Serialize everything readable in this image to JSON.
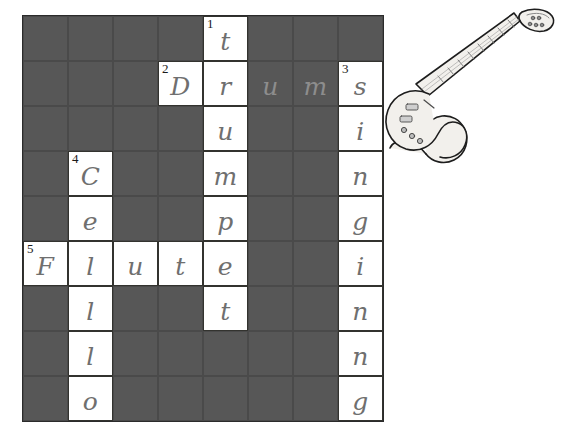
{
  "worksheet": {
    "title": "Musical instruments crossword",
    "grid": {
      "columns": 8,
      "rows": 9,
      "blocked_color": "#575757",
      "open_color": "#ffffff",
      "pencil_color": "#6f6f6f"
    },
    "clue_numbers": [
      {
        "number": "1",
        "row": 1,
        "col": 5
      },
      {
        "number": "2",
        "row": 2,
        "col": 4
      },
      {
        "number": "3",
        "row": 2,
        "col": 8
      },
      {
        "number": "4",
        "row": 4,
        "col": 2
      },
      {
        "number": "5",
        "row": 6,
        "col": 1
      }
    ],
    "answers": [
      {
        "number": "1",
        "direction": "down",
        "text": "TRUMPET"
      },
      {
        "number": "2",
        "direction": "across",
        "text": "DRUMS"
      },
      {
        "number": "3",
        "direction": "down",
        "text": "SINGING"
      },
      {
        "number": "4",
        "direction": "down",
        "text": "CELLO"
      },
      {
        "number": "5",
        "direction": "across",
        "text": "FLUTE"
      }
    ],
    "cells": [
      [
        {
          "state": "blocked",
          "letter": "",
          "num": ""
        },
        {
          "state": "blocked",
          "letter": "",
          "num": ""
        },
        {
          "state": "blocked",
          "letter": "",
          "num": ""
        },
        {
          "state": "blocked",
          "letter": "",
          "num": ""
        },
        {
          "state": "open",
          "letter": "t",
          "num": "1"
        },
        {
          "state": "blocked",
          "letter": "",
          "num": ""
        },
        {
          "state": "blocked",
          "letter": "",
          "num": ""
        },
        {
          "state": "blocked",
          "letter": "",
          "num": ""
        }
      ],
      [
        {
          "state": "blocked",
          "letter": "",
          "num": ""
        },
        {
          "state": "blocked",
          "letter": "",
          "num": ""
        },
        {
          "state": "blocked",
          "letter": "",
          "num": ""
        },
        {
          "state": "open",
          "letter": "D",
          "num": "2"
        },
        {
          "state": "open",
          "letter": "r",
          "num": ""
        },
        {
          "state": "blocked",
          "letter": "u",
          "num": ""
        },
        {
          "state": "blocked",
          "letter": "m",
          "num": ""
        },
        {
          "state": "open",
          "letter": "s",
          "num": "3"
        }
      ],
      [
        {
          "state": "blocked",
          "letter": "",
          "num": ""
        },
        {
          "state": "blocked",
          "letter": "",
          "num": ""
        },
        {
          "state": "blocked",
          "letter": "",
          "num": ""
        },
        {
          "state": "blocked",
          "letter": "",
          "num": ""
        },
        {
          "state": "open",
          "letter": "u",
          "num": ""
        },
        {
          "state": "blocked",
          "letter": "",
          "num": ""
        },
        {
          "state": "blocked",
          "letter": "",
          "num": ""
        },
        {
          "state": "open",
          "letter": "i",
          "num": ""
        }
      ],
      [
        {
          "state": "blocked",
          "letter": "",
          "num": ""
        },
        {
          "state": "open",
          "letter": "C",
          "num": "4"
        },
        {
          "state": "blocked",
          "letter": "",
          "num": ""
        },
        {
          "state": "blocked",
          "letter": "",
          "num": ""
        },
        {
          "state": "open",
          "letter": "m",
          "num": ""
        },
        {
          "state": "blocked",
          "letter": "",
          "num": ""
        },
        {
          "state": "blocked",
          "letter": "",
          "num": ""
        },
        {
          "state": "open",
          "letter": "n",
          "num": ""
        }
      ],
      [
        {
          "state": "blocked",
          "letter": "",
          "num": ""
        },
        {
          "state": "open",
          "letter": "e",
          "num": ""
        },
        {
          "state": "blocked",
          "letter": "",
          "num": ""
        },
        {
          "state": "blocked",
          "letter": "",
          "num": ""
        },
        {
          "state": "open",
          "letter": "p",
          "num": ""
        },
        {
          "state": "blocked",
          "letter": "",
          "num": ""
        },
        {
          "state": "blocked",
          "letter": "",
          "num": ""
        },
        {
          "state": "open",
          "letter": "g",
          "num": ""
        }
      ],
      [
        {
          "state": "open",
          "letter": "F",
          "num": "5"
        },
        {
          "state": "open",
          "letter": "l",
          "num": ""
        },
        {
          "state": "open",
          "letter": "u",
          "num": ""
        },
        {
          "state": "open",
          "letter": "t",
          "num": ""
        },
        {
          "state": "open",
          "letter": "e",
          "num": ""
        },
        {
          "state": "blocked",
          "letter": "",
          "num": ""
        },
        {
          "state": "blocked",
          "letter": "",
          "num": ""
        },
        {
          "state": "open",
          "letter": "i",
          "num": ""
        }
      ],
      [
        {
          "state": "blocked",
          "letter": "",
          "num": ""
        },
        {
          "state": "open",
          "letter": "l",
          "num": ""
        },
        {
          "state": "blocked",
          "letter": "",
          "num": ""
        },
        {
          "state": "blocked",
          "letter": "",
          "num": ""
        },
        {
          "state": "open",
          "letter": "t",
          "num": ""
        },
        {
          "state": "blocked",
          "letter": "",
          "num": ""
        },
        {
          "state": "blocked",
          "letter": "",
          "num": ""
        },
        {
          "state": "open",
          "letter": "n",
          "num": ""
        }
      ],
      [
        {
          "state": "blocked",
          "letter": "",
          "num": ""
        },
        {
          "state": "open",
          "letter": "l",
          "num": ""
        },
        {
          "state": "blocked",
          "letter": "",
          "num": ""
        },
        {
          "state": "blocked",
          "letter": "",
          "num": ""
        },
        {
          "state": "blocked",
          "letter": "",
          "num": ""
        },
        {
          "state": "blocked",
          "letter": "",
          "num": ""
        },
        {
          "state": "blocked",
          "letter": "",
          "num": ""
        },
        {
          "state": "open",
          "letter": "n",
          "num": ""
        }
      ],
      [
        {
          "state": "blocked",
          "letter": "",
          "num": ""
        },
        {
          "state": "open",
          "letter": "o",
          "num": ""
        },
        {
          "state": "blocked",
          "letter": "",
          "num": ""
        },
        {
          "state": "blocked",
          "letter": "",
          "num": ""
        },
        {
          "state": "blocked",
          "letter": "",
          "num": ""
        },
        {
          "state": "blocked",
          "letter": "",
          "num": ""
        },
        {
          "state": "blocked",
          "letter": "",
          "num": ""
        },
        {
          "state": "open",
          "letter": "g",
          "num": ""
        }
      ]
    ]
  },
  "illustration": {
    "name": "electric-guitar",
    "outline_color": "#1d1d1d",
    "body_color": "#f2f0ec",
    "detail_color": "#8a8a8a"
  }
}
